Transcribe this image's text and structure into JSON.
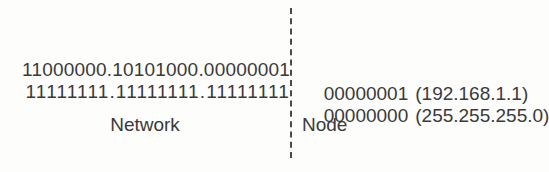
{
  "diagram": {
    "type": "ip-address-subnet-mask-split",
    "background_color": "#fdfdfc",
    "text_color": "#3a3a3a",
    "divider": {
      "name": "network-node-boundary",
      "style": "dashed",
      "color": "#4a4a4a",
      "orientation": "vertical"
    },
    "rows": [
      {
        "id": "ip-address",
        "network_bits": "11000000.10101000.00000001",
        "node_bits": "00000001",
        "dotted_decimal": "(192.168.1.1)"
      },
      {
        "id": "subnet-mask",
        "network_bits": "11111111.11111111.11111111",
        "node_bits": "00000000",
        "dotted_decimal": "(255.255.255.0)"
      }
    ],
    "captions": {
      "network": "Network",
      "node": "Node"
    }
  }
}
